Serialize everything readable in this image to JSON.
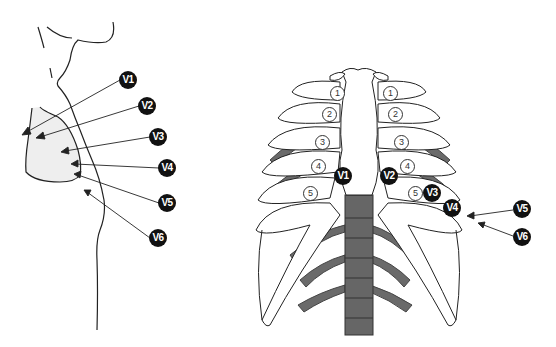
{
  "diagram": {
    "colors": {
      "badge": "#111111",
      "bone_shadow": "#666666",
      "breast_fill": "#eeeeee",
      "line": "#222222"
    },
    "side_view": {
      "labels": [
        {
          "id": "V1",
          "text": "V1",
          "x": 119,
          "y": 71
        },
        {
          "id": "V2",
          "text": "V2",
          "x": 138,
          "y": 97
        },
        {
          "id": "V3",
          "text": "V3",
          "x": 149,
          "y": 128
        },
        {
          "id": "V4",
          "text": "V4",
          "x": 158,
          "y": 159
        },
        {
          "id": "V5",
          "text": "V5",
          "x": 158,
          "y": 194
        },
        {
          "id": "V6",
          "text": "V6",
          "x": 149,
          "y": 229
        }
      ]
    },
    "front_view": {
      "rib_numbers": [
        {
          "text": "1",
          "x": 330,
          "y": 86
        },
        {
          "text": "1",
          "x": 383,
          "y": 86
        },
        {
          "text": "2",
          "x": 322,
          "y": 107
        },
        {
          "text": "2",
          "x": 388,
          "y": 107
        },
        {
          "text": "3",
          "x": 315,
          "y": 135
        },
        {
          "text": "3",
          "x": 394,
          "y": 135
        },
        {
          "text": "4",
          "x": 311,
          "y": 159
        },
        {
          "text": "4",
          "x": 400,
          "y": 159
        },
        {
          "text": "5",
          "x": 303,
          "y": 186
        },
        {
          "text": "5",
          "x": 408,
          "y": 186
        }
      ],
      "labels": [
        {
          "id": "V1",
          "text": "V1",
          "x": 334,
          "y": 167
        },
        {
          "id": "V2",
          "text": "V2",
          "x": 380,
          "y": 167
        },
        {
          "id": "V3",
          "text": "V3",
          "x": 423,
          "y": 184
        },
        {
          "id": "V4",
          "text": "V4",
          "x": 443,
          "y": 199
        },
        {
          "id": "V5",
          "text": "V5",
          "x": 513,
          "y": 200
        },
        {
          "id": "V6",
          "text": "V6",
          "x": 513,
          "y": 228
        }
      ]
    }
  }
}
